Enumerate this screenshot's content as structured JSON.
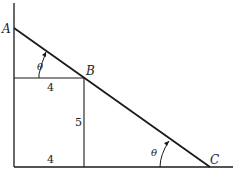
{
  "diagram": {
    "points": {
      "A": "A",
      "B": "B",
      "C": "C"
    },
    "angle_labels": {
      "upper": "θ",
      "lower": "θ"
    },
    "lengths": {
      "upper_horizontal": "4",
      "vertical_from_B": "5",
      "bottom_horizontal": "4"
    },
    "colors": {
      "line": "#1a1a1a",
      "background": "#ffffff"
    }
  }
}
